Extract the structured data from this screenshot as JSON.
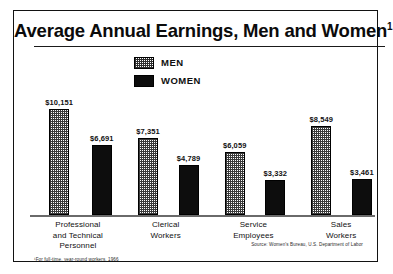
{
  "chart_data": {
    "type": "bar",
    "title": "Average Annual Earnings, Men and Women",
    "title_superscript": "1",
    "xlabel": "",
    "ylabel": "",
    "ylim": [
      0,
      10151
    ],
    "grid": false,
    "legend_position": "top-center",
    "categories": [
      "Professional and Technical Personnel",
      "Clerical Workers",
      "Service Employees",
      "Sales Workers"
    ],
    "category_lines": [
      [
        "Professional",
        "and Technical",
        "Personnel"
      ],
      [
        "Clerical",
        "Workers"
      ],
      [
        "Service",
        "Employees"
      ],
      [
        "Sales",
        "Workers"
      ]
    ],
    "series": [
      {
        "name": "MEN",
        "pattern": "checkered-halftone",
        "color": "#ffffff",
        "values": [
          10151,
          7351,
          6059,
          8549
        ],
        "labels": [
          "$10,151",
          "$7,351",
          "$6,059",
          "$8,549"
        ]
      },
      {
        "name": "WOMEN",
        "pattern": "solid",
        "color": "#0d0d0d",
        "values": [
          6691,
          4789,
          3332,
          3461
        ],
        "labels": [
          "$6,691",
          "$4,789",
          "$3,332",
          "$3,461"
        ]
      }
    ],
    "footnote": "¹For full-time, year-round workers, 1966",
    "source": "Source: Women's Bureau, U.S. Department of Labor"
  },
  "legend": {
    "items": [
      {
        "label": "MEN"
      },
      {
        "label": "WOMEN"
      }
    ]
  }
}
